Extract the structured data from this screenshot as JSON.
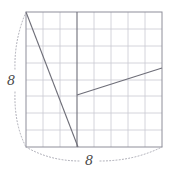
{
  "figure": {
    "kind": "geometry-diagram",
    "canvas": {
      "width": 172,
      "height": 174
    },
    "colors": {
      "grid_line": "#c9c9d2",
      "border_line": "#8e8e99",
      "segment_line": "#6e6e78",
      "dimension_line": "#a9a9b3",
      "label_text": "#4a4a4a",
      "background": "#ffffff"
    },
    "square": {
      "left": 26,
      "top": 12,
      "right": 162,
      "bottom": 147,
      "cells_x": 8,
      "cells_y": 8,
      "cell_size": 17
    },
    "segments": [
      {
        "name": "descending-diagonal",
        "x1": 26,
        "y1": 12,
        "x2": 78,
        "y2": 147
      },
      {
        "name": "interior-vertical",
        "x1": 77,
        "y1": 12,
        "x2": 77,
        "y2": 147
      },
      {
        "name": "ascending-diagonal",
        "x1": 77,
        "y1": 95,
        "x2": 162,
        "y2": 68
      }
    ],
    "dimensions": [
      {
        "name": "height-dimension",
        "label": "8",
        "orientation": "vertical",
        "side": "left",
        "from_y": 12,
        "to_y": 147,
        "bracket_x": 18,
        "bulge": 6
      },
      {
        "name": "width-dimension",
        "label": "8",
        "orientation": "horizontal",
        "side": "bottom",
        "from_x": 26,
        "to_x": 162,
        "bracket_y": 155,
        "bulge": 6
      }
    ]
  },
  "labels": {
    "height": "8",
    "width": "8"
  }
}
